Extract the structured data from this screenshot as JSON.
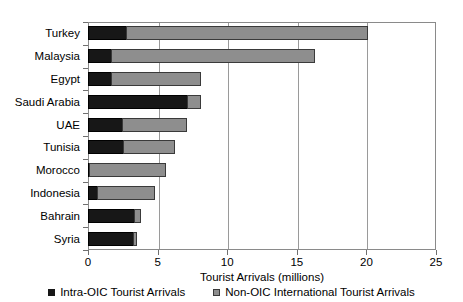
{
  "chart_data": {
    "type": "bar",
    "orientation": "horizontal",
    "stacked": true,
    "title": "",
    "xlabel": "Tourist Arrivals (millions)",
    "ylabel": "",
    "xlim": [
      0,
      25
    ],
    "xticks": [
      0,
      5,
      10,
      15,
      20,
      25
    ],
    "xtick_labels": [
      "0",
      "5",
      "10",
      "15",
      "20",
      "25"
    ],
    "grid": true,
    "grid_axis": "x",
    "legend_position": "bottom",
    "categories": [
      "Turkey",
      "Malaysia",
      "Egypt",
      "Saudi Arabia",
      "UAE",
      "Tunisia",
      "Morocco",
      "Indonesia",
      "Bahrain",
      "Syria"
    ],
    "series": [
      {
        "name": "Intra-OIC Tourist Arrivals",
        "color": "#171717",
        "values": [
          2.8,
          1.7,
          1.7,
          7.2,
          2.5,
          2.6,
          0.15,
          0.7,
          3.4,
          3.3
        ]
      },
      {
        "name": "Non-OIC International Tourist Arrivals",
        "color": "#8e8e8e",
        "values": [
          17.4,
          14.7,
          6.5,
          1.0,
          4.7,
          3.7,
          5.5,
          4.2,
          0.5,
          0.3
        ]
      }
    ],
    "totals": [
      20.2,
      16.4,
      8.2,
      8.2,
      7.2,
      6.3,
      5.65,
      4.9,
      3.9,
      3.6
    ]
  },
  "legend": {
    "items": [
      {
        "label": "Intra-OIC Tourist Arrivals"
      },
      {
        "label": "Non-OIC International Tourist Arrivals"
      }
    ]
  }
}
